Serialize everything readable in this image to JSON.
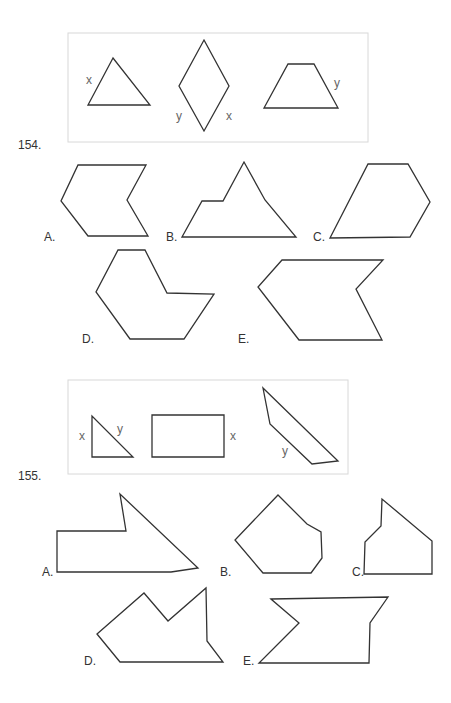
{
  "problems": [
    {
      "number": "154.",
      "example_box": {
        "labels": [
          {
            "text": "x",
            "x": 86,
            "y": 74
          },
          {
            "text": "y",
            "x": 176,
            "y": 110
          },
          {
            "text": "x",
            "x": 226,
            "y": 110
          },
          {
            "text": "y",
            "x": 334,
            "y": 77
          }
        ],
        "shapes": [
          "113,58 88,105 150,105",
          "204,40 229,86 204,131 179,86",
          "288,64 314,64 338,108 264,108"
        ]
      },
      "options": [
        {
          "label": "A.",
          "lx": 44,
          "ly": 231,
          "points": "78,165 146,165 127,200 148,236 88,236 61,201"
        },
        {
          "label": "B.",
          "lx": 166,
          "ly": 231,
          "points": "182,237 202,201 223,201 244,162 265,200 296,237"
        },
        {
          "label": "C.",
          "lx": 313,
          "ly": 231,
          "points": "330,238 368,164 408,164 430,202 410,237"
        },
        {
          "label": "D.",
          "lx": 82,
          "ly": 333,
          "points": "118,250 145,250 167,293 214,294 184,339 130,339 96,292"
        },
        {
          "label": "E.",
          "lx": 238,
          "ly": 333,
          "points": "282,260 383,260 356,289 382,340 299,340 258,287"
        }
      ]
    },
    {
      "number": "155.",
      "example_box": {
        "labels": [
          {
            "text": "x",
            "x": 79,
            "y": 430
          },
          {
            "text": "y",
            "x": 117,
            "y": 423
          },
          {
            "text": "x",
            "x": 230,
            "y": 430
          },
          {
            "text": "y",
            "x": 282,
            "y": 445
          }
        ],
        "shapes": [
          "92,416 92,457 133,457",
          "152,415 224,415 224,457 152,457",
          "263,388 338,461 312,464 270,424"
        ]
      },
      "options": [
        {
          "label": "A.",
          "lx": 42,
          "ly": 566,
          "points": "57,572 57,531 126,531 120,494 198,568 171,572"
        },
        {
          "label": "B.",
          "lx": 220,
          "ly": 566,
          "points": "278,495 307,524 321,532 322,558 311,573 263,573 235,540"
        },
        {
          "label": "C.",
          "lx": 352,
          "ly": 566,
          "points": "382,499 381,526 365,542 364,574 432,574 432,541"
        },
        {
          "label": "D.",
          "lx": 84,
          "ly": 655,
          "points": "97,634 144,593 168,621 206,588 207,641 223,662 120,662"
        },
        {
          "label": "E.",
          "lx": 243,
          "ly": 655,
          "points": "271,599 388,597 370,623 369,663 259,663 299,623"
        }
      ]
    }
  ]
}
